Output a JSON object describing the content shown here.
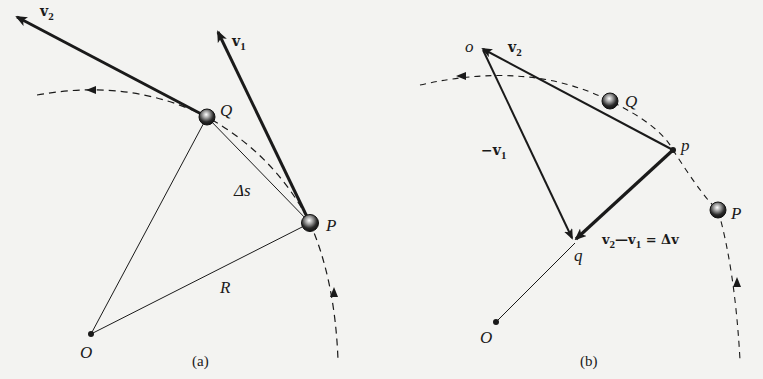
{
  "figure": {
    "panel_a": {
      "caption": "(a)",
      "labels": {
        "v2": "v",
        "v2_sub": "2",
        "v1": "v",
        "v1_sub": "1",
        "Q": "Q",
        "P": "P",
        "delta_s": "Δs",
        "R": "R",
        "O": "O"
      }
    },
    "panel_b": {
      "caption": "(b)",
      "labels": {
        "o": "o",
        "v2": "v",
        "v2_sub": "2",
        "Q": "Q",
        "p": "p",
        "neg_v1": "−v",
        "neg_v1_sub": "1",
        "P": "P",
        "delta_v_eq_a": "v",
        "delta_v_eq_a_sub": "2",
        "delta_v_eq_b": "—v",
        "delta_v_eq_b_sub": "1",
        "delta_v_eq_c": " = Δv",
        "q": "q",
        "O": "O"
      }
    },
    "colors": {
      "ink": "#1a1a1a",
      "background": "#f3f3f1"
    }
  }
}
